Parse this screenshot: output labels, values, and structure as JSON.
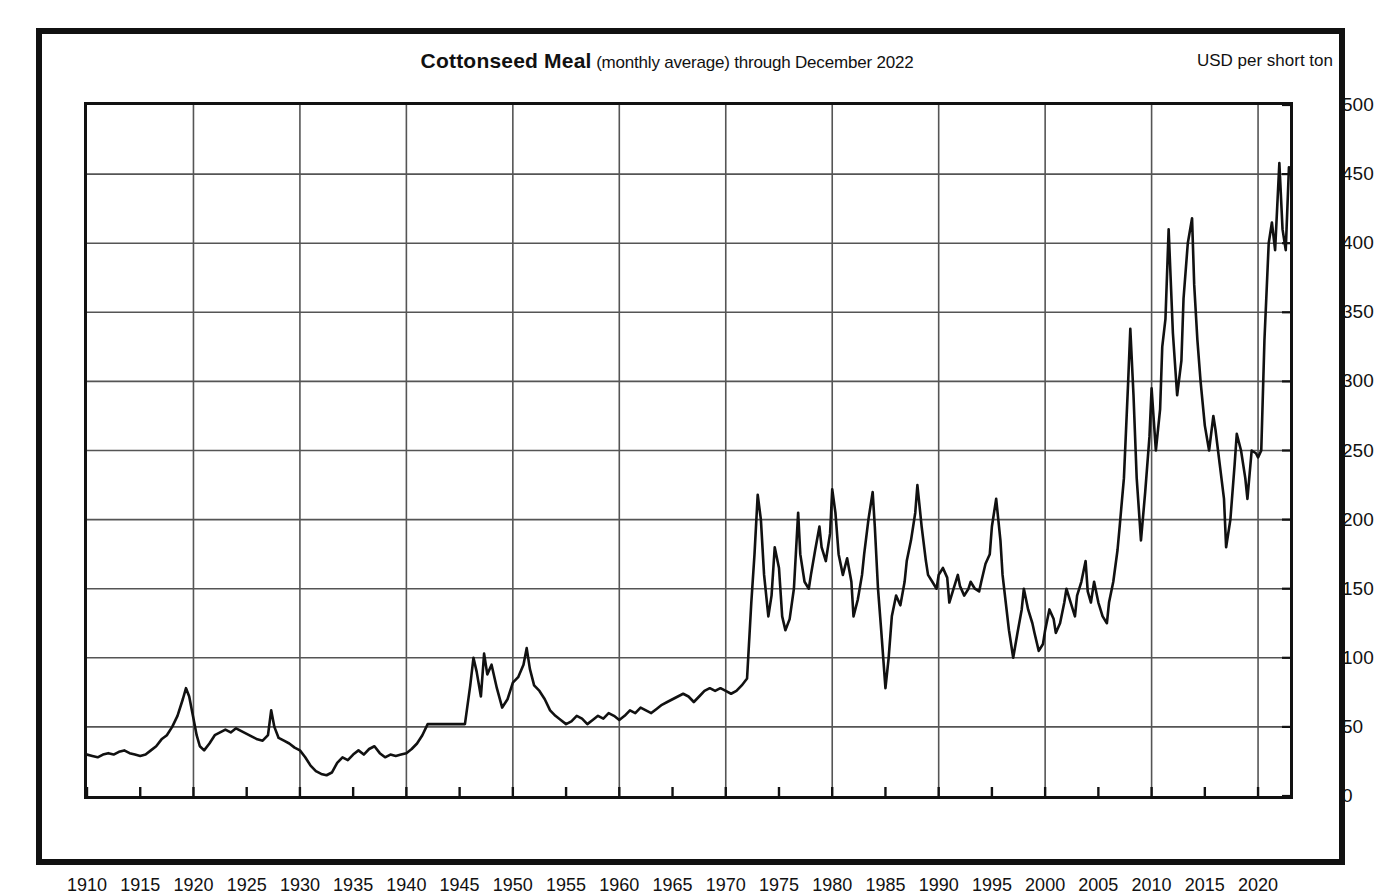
{
  "figure": {
    "title_main": "Cottonseed  Meal",
    "title_sub": " (monthly average) through December 2022",
    "unit_label": "USD per short ton"
  },
  "chart_data": {
    "type": "line",
    "title": "Cottonseed Meal (monthly average) through December 2022",
    "subtitle": "(monthly average) through December 2022",
    "xlabel": "",
    "ylabel": "USD per short ton",
    "xlim": [
      1910,
      2023
    ],
    "ylim": [
      0,
      500
    ],
    "grid": true,
    "legend": "none",
    "x_ticks": [
      1910,
      1915,
      1920,
      1925,
      1930,
      1935,
      1940,
      1945,
      1950,
      1955,
      1960,
      1965,
      1970,
      1975,
      1980,
      1985,
      1990,
      1995,
      2000,
      2005,
      2010,
      2015,
      2020
    ],
    "x_gridlines": [
      1910,
      1920,
      1930,
      1940,
      1950,
      1960,
      1970,
      1980,
      1990,
      2000,
      2010,
      2020
    ],
    "y_ticks": [
      0,
      50,
      100,
      150,
      200,
      250,
      300,
      350,
      400,
      450,
      500
    ],
    "series_name": "Cottonseed Meal price",
    "line_color": "#111111",
    "x": [
      1910.0,
      1910.5,
      1911.0,
      1911.5,
      1912.0,
      1912.5,
      1913.0,
      1913.5,
      1914.0,
      1914.5,
      1915.0,
      1915.5,
      1916.0,
      1916.5,
      1917.0,
      1917.5,
      1918.0,
      1918.5,
      1919.0,
      1919.3,
      1919.6,
      1920.0,
      1920.3,
      1920.6,
      1921.0,
      1921.5,
      1922.0,
      1922.5,
      1923.0,
      1923.5,
      1924.0,
      1924.5,
      1925.0,
      1925.5,
      1926.0,
      1926.5,
      1927.0,
      1927.3,
      1927.6,
      1928.0,
      1928.5,
      1929.0,
      1929.5,
      1930.0,
      1930.5,
      1931.0,
      1931.5,
      1932.0,
      1932.5,
      1933.0,
      1933.5,
      1934.0,
      1934.5,
      1935.0,
      1935.5,
      1936.0,
      1936.5,
      1937.0,
      1937.5,
      1938.0,
      1938.5,
      1939.0,
      1939.5,
      1940.0,
      1940.5,
      1941.0,
      1941.5,
      1942.0,
      1943.0,
      1944.0,
      1945.0,
      1945.5,
      1946.0,
      1946.3,
      1946.6,
      1947.0,
      1947.3,
      1947.6,
      1948.0,
      1948.5,
      1949.0,
      1949.5,
      1950.0,
      1950.5,
      1951.0,
      1951.3,
      1951.6,
      1952.0,
      1952.5,
      1953.0,
      1953.5,
      1954.0,
      1954.5,
      1955.0,
      1955.5,
      1956.0,
      1956.5,
      1957.0,
      1957.5,
      1958.0,
      1958.5,
      1959.0,
      1959.5,
      1960.0,
      1960.5,
      1961.0,
      1961.5,
      1962.0,
      1962.5,
      1963.0,
      1963.5,
      1964.0,
      1964.5,
      1965.0,
      1965.5,
      1966.0,
      1966.5,
      1967.0,
      1967.5,
      1968.0,
      1968.5,
      1969.0,
      1969.5,
      1970.0,
      1970.5,
      1971.0,
      1971.5,
      1972.0,
      1972.4,
      1972.7,
      1973.0,
      1973.3,
      1973.6,
      1974.0,
      1974.3,
      1974.6,
      1975.0,
      1975.3,
      1975.6,
      1976.0,
      1976.4,
      1976.8,
      1977.0,
      1977.4,
      1977.8,
      1978.0,
      1978.4,
      1978.8,
      1979.0,
      1979.4,
      1979.8,
      1980.0,
      1980.3,
      1980.6,
      1981.0,
      1981.4,
      1981.8,
      1982.0,
      1982.4,
      1982.8,
      1983.0,
      1983.4,
      1983.8,
      1984.0,
      1984.3,
      1984.6,
      1985.0,
      1985.3,
      1985.6,
      1986.0,
      1986.4,
      1986.8,
      1987.0,
      1987.4,
      1987.8,
      1988.0,
      1988.4,
      1988.8,
      1989.0,
      1989.4,
      1989.8,
      1990.0,
      1990.4,
      1990.8,
      1991.0,
      1991.4,
      1991.8,
      1992.0,
      1992.4,
      1992.8,
      1993.0,
      1993.4,
      1993.8,
      1994.0,
      1994.4,
      1994.8,
      1995.0,
      1995.4,
      1995.8,
      1996.0,
      1996.3,
      1996.6,
      1997.0,
      1997.4,
      1997.8,
      1998.0,
      1998.4,
      1998.8,
      1999.0,
      1999.4,
      1999.8,
      2000.0,
      2000.4,
      2000.8,
      2001.0,
      2001.4,
      2001.8,
      2002.0,
      2002.4,
      2002.8,
      2003.0,
      2003.4,
      2003.8,
      2004.0,
      2004.3,
      2004.6,
      2005.0,
      2005.4,
      2005.8,
      2006.0,
      2006.4,
      2006.8,
      2007.0,
      2007.4,
      2007.8,
      2008.0,
      2008.3,
      2008.6,
      2009.0,
      2009.4,
      2009.8,
      2010.0,
      2010.4,
      2010.8,
      2011.0,
      2011.3,
      2011.6,
      2012.0,
      2012.4,
      2012.8,
      2013.0,
      2013.4,
      2013.8,
      2014.0,
      2014.3,
      2014.6,
      2015.0,
      2015.4,
      2015.8,
      2016.0,
      2016.4,
      2016.8,
      2017.0,
      2017.4,
      2017.8,
      2018.0,
      2018.4,
      2018.8,
      2019.0,
      2019.4,
      2019.8,
      2020.0,
      2020.3,
      2020.6,
      2021.0,
      2021.3,
      2021.6,
      2022.0,
      2022.3,
      2022.6,
      2022.9
    ],
    "y": [
      30,
      29,
      28,
      30,
      31,
      30,
      32,
      33,
      31,
      30,
      29,
      30,
      33,
      36,
      41,
      44,
      50,
      58,
      70,
      78,
      72,
      56,
      44,
      36,
      33,
      38,
      44,
      46,
      48,
      46,
      49,
      47,
      45,
      43,
      41,
      40,
      44,
      62,
      50,
      42,
      40,
      38,
      35,
      33,
      28,
      22,
      18,
      16,
      15,
      17,
      24,
      28,
      26,
      30,
      33,
      30,
      34,
      36,
      31,
      28,
      30,
      29,
      30,
      31,
      34,
      38,
      44,
      52,
      52,
      52,
      52,
      52,
      80,
      100,
      90,
      72,
      103,
      88,
      95,
      78,
      64,
      70,
      82,
      86,
      95,
      107,
      92,
      80,
      76,
      70,
      62,
      58,
      55,
      52,
      54,
      58,
      56,
      52,
      55,
      58,
      56,
      60,
      58,
      55,
      58,
      62,
      60,
      64,
      62,
      60,
      63,
      66,
      68,
      70,
      72,
      74,
      72,
      68,
      72,
      76,
      78,
      76,
      78,
      76,
      74,
      76,
      80,
      85,
      140,
      175,
      218,
      200,
      160,
      130,
      145,
      180,
      165,
      130,
      120,
      128,
      150,
      205,
      175,
      155,
      150,
      160,
      178,
      195,
      180,
      170,
      190,
      222,
      205,
      175,
      160,
      172,
      155,
      130,
      142,
      160,
      175,
      200,
      220,
      195,
      150,
      120,
      78,
      100,
      130,
      145,
      138,
      155,
      170,
      185,
      205,
      225,
      195,
      170,
      160,
      155,
      150,
      160,
      165,
      158,
      140,
      150,
      160,
      152,
      145,
      150,
      155,
      150,
      148,
      155,
      168,
      175,
      195,
      215,
      185,
      160,
      140,
      120,
      100,
      118,
      135,
      150,
      135,
      125,
      118,
      105,
      110,
      120,
      135,
      128,
      118,
      125,
      140,
      150,
      140,
      130,
      145,
      155,
      170,
      148,
      140,
      155,
      140,
      130,
      125,
      140,
      155,
      178,
      195,
      230,
      300,
      338,
      290,
      230,
      185,
      220,
      260,
      295,
      250,
      280,
      325,
      345,
      410,
      335,
      290,
      315,
      360,
      400,
      418,
      370,
      330,
      300,
      268,
      250,
      275,
      265,
      240,
      215,
      180,
      200,
      240,
      262,
      250,
      230,
      215,
      250,
      248,
      245,
      250,
      330,
      400,
      415,
      395,
      458,
      410,
      395,
      455
    ],
    "annotations": [
      {
        "year": 1919,
        "value": 78,
        "note": "post-WWI peak"
      },
      {
        "year": 1932,
        "value": 15,
        "note": "Great Depression low"
      },
      {
        "year": 1941,
        "value": 52,
        "note": "wartime price plateau begins"
      },
      {
        "year": 1951,
        "value": 107,
        "note": "Korean War era peak"
      },
      {
        "year": 1973,
        "value": 218,
        "note": "1973 commodity spike"
      },
      {
        "year": 1980,
        "value": 222,
        "note": "1980 peak"
      },
      {
        "year": 1985,
        "value": 78,
        "note": "mid-1980s trough"
      },
      {
        "year": 2008,
        "value": 338,
        "note": "2008 commodity boom"
      },
      {
        "year": 2013,
        "value": 418,
        "note": "2013 high"
      },
      {
        "year": 2022,
        "value": 458,
        "note": "2022 record high"
      }
    ]
  }
}
